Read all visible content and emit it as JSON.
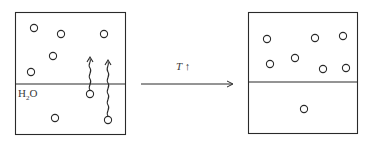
{
  "diagram": {
    "left_box": {
      "label_liquid": "H",
      "label_liquid_sub": "2",
      "label_liquid_end": "O",
      "gas_molecules": 5,
      "liquid_molecules": 3,
      "escaping_molecules": 2
    },
    "arrow": {
      "label": "T",
      "label_suffix": "↑"
    },
    "right_box": {
      "gas_molecules": 7,
      "liquid_molecules": 1
    },
    "colors": {
      "line": "#2a2a2a",
      "background": "#ffffff"
    }
  }
}
